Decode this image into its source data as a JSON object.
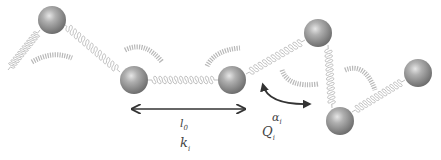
{
  "diagram": {
    "title": "",
    "colors": {
      "bead": "#9a9a9a",
      "spring": "#b8b8b8",
      "arrow": "#333333",
      "text": "#444444"
    },
    "labels": {
      "rest_length": "l",
      "rest_length_sub": "0",
      "stretch_stiffness": "k",
      "stretch_stiffness_sub": "i",
      "bend_angle": "α",
      "bend_angle_sub": "i",
      "bend_stiffness": "Q",
      "bend_stiffness_sub": "i"
    },
    "beads": [
      "bead-1",
      "bead-2",
      "bead-3",
      "bead-4",
      "bead-5",
      "bead-6"
    ],
    "stretch_springs": 6,
    "bend_springs": 4
  }
}
